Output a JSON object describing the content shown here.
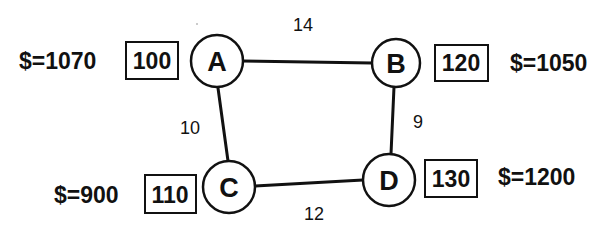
{
  "diagram": {
    "type": "weighted-graph",
    "nodes": [
      {
        "id": "A",
        "label": "A",
        "value": "100",
        "money": "$=1070"
      },
      {
        "id": "B",
        "label": "B",
        "value": "120",
        "money": "$=1050"
      },
      {
        "id": "C",
        "label": "C",
        "value": "110",
        "money": "$=900"
      },
      {
        "id": "D",
        "label": "D",
        "value": "130",
        "money": "$=1200"
      }
    ],
    "edges": [
      {
        "from": "A",
        "to": "B",
        "weight": "14"
      },
      {
        "from": "A",
        "to": "C",
        "weight": "10"
      },
      {
        "from": "B",
        "to": "D",
        "weight": "9"
      },
      {
        "from": "C",
        "to": "D",
        "weight": "12"
      }
    ]
  },
  "colors": {
    "ink": "#111111",
    "background": "#ffffff"
  }
}
